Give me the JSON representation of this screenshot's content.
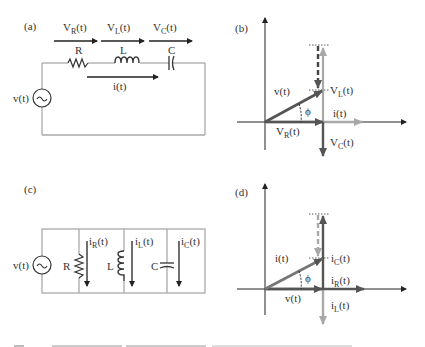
{
  "colors": {
    "wire": "#a9a9a9",
    "dark_phasor": "#555555",
    "light_phasor": "#a8a8a8",
    "axis": "#222222",
    "text": "#333333"
  },
  "panel_a": {
    "label": "(a)",
    "voltages": [
      {
        "main": "V",
        "sub": "R",
        "tail": "(t)"
      },
      {
        "main": "V",
        "sub": "L",
        "tail": "(t)"
      },
      {
        "main": "V",
        "sub": "C",
        "tail": "(t)"
      }
    ],
    "components": {
      "R": "R",
      "L": "L",
      "C": "C"
    },
    "current": "i(t)",
    "source": "v(t)"
  },
  "panel_b": {
    "label": "(b)",
    "vt": "v(t)",
    "phi": "ϕ",
    "it": "i(t)",
    "VL": {
      "main": "V",
      "sub": "L",
      "tail": "(t)"
    },
    "VR": {
      "main": "V",
      "sub": "R",
      "tail": "(t)"
    },
    "VC": {
      "main": "V",
      "sub": "C",
      "tail": "(t)"
    }
  },
  "panel_c": {
    "label": "(c)",
    "source": "v(t)",
    "components": {
      "R": "R",
      "L": "L",
      "C": "C"
    },
    "currents": [
      {
        "main": "i",
        "sub": "R",
        "tail": "(t)"
      },
      {
        "main": "i",
        "sub": "L",
        "tail": "(t)"
      },
      {
        "main": "i",
        "sub": "C",
        "tail": "(t)"
      }
    ]
  },
  "panel_d": {
    "label": "(d)",
    "it": "i(t)",
    "phi": "ϕ",
    "vt": "v(t)",
    "iC": {
      "main": "i",
      "sub": "C",
      "tail": "(t)"
    },
    "iR": {
      "main": "i",
      "sub": "R",
      "tail": "(t)"
    },
    "iL": {
      "main": "i",
      "sub": "L",
      "tail": "(t)"
    }
  }
}
